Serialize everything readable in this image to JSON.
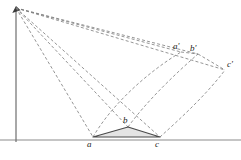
{
  "figure": {
    "canvas": {
      "width": 241,
      "height": 160,
      "background": "#ffffff"
    },
    "colors": {
      "solid_line": "#4a4a4a",
      "dashed_line": "#7a7a7a",
      "axis_line": "#6e6e6e",
      "ground_line": "#8c8c8c",
      "triangle_fill": "#e4e4e4",
      "label_text": "#1d1d1d"
    },
    "style": {
      "dash_pattern": "3,2.2",
      "solid_stroke_width": 1.1,
      "dashed_stroke_width": 0.8,
      "arc_stroke_width": 0.8
    }
  },
  "points": {
    "apex": {
      "name": "apex",
      "label": "",
      "x": 16,
      "y": 8
    },
    "a": {
      "name": "a",
      "label": "a",
      "x": 93,
      "y": 137
    },
    "b": {
      "name": "b",
      "label": "b",
      "x": 128,
      "y": 127
    },
    "c": {
      "name": "c",
      "label": "c",
      "x": 160,
      "y": 137
    },
    "a_pri": {
      "name": "a'",
      "label": "a'",
      "x": 181,
      "y": 52
    },
    "b_pri": {
      "name": "b'",
      "label": "b'",
      "x": 198,
      "y": 54
    },
    "c_pri": {
      "name": "c'",
      "label": "c'",
      "x": 225,
      "y": 70
    }
  },
  "labels": [
    {
      "id": "label-a",
      "text": "a",
      "x": 87,
      "y": 140
    },
    {
      "id": "label-b",
      "text": "b",
      "x": 123,
      "y": 116
    },
    {
      "id": "label-c",
      "text": "c",
      "x": 155,
      "y": 140
    },
    {
      "id": "label-a-prime",
      "text": "a'",
      "x": 173,
      "y": 42
    },
    {
      "id": "label-b-prime",
      "text": "b'",
      "x": 190,
      "y": 44
    },
    {
      "id": "label-c-prime",
      "text": "c'",
      "x": 227,
      "y": 60
    }
  ],
  "axes": {
    "vertical": {
      "name": "vertical-axis",
      "x1": 16,
      "y1": 10,
      "x2": 16,
      "y2": 142
    },
    "ground": {
      "name": "ground-line",
      "x1": 0,
      "y1": 140,
      "x2": 241,
      "y2": 140
    },
    "arrowhead": {
      "name": "axis-arrowhead",
      "x": 16,
      "y": 8,
      "size": 5
    }
  },
  "triangle": {
    "name": "triangle-abc",
    "path": "M 93 137 L 128 127 L 160 137 Z",
    "fill": "#e4e4e4",
    "stroke": "#4a4a4a"
  },
  "dashed_triangle": {
    "name": "triangle-a-prime-b-prime-c-prime",
    "segments": [
      {
        "id": "seg-ap-bp",
        "x1": 181,
        "y1": 52,
        "x2": 198,
        "y2": 54
      },
      {
        "id": "seg-bp-cp",
        "x1": 198,
        "y1": 54,
        "x2": 225,
        "y2": 70
      }
    ]
  },
  "rays": [
    {
      "id": "ray-apex-a-prime",
      "from": "apex",
      "to": "a_pri",
      "x1": 16,
      "y1": 8,
      "x2": 181,
      "y2": 52
    },
    {
      "id": "ray-apex-b-prime",
      "from": "apex",
      "to": "b_pri",
      "x1": 16,
      "y1": 8,
      "x2": 198,
      "y2": 54
    },
    {
      "id": "ray-apex-c-prime",
      "from": "apex",
      "to": "c_pri",
      "x1": 16,
      "y1": 8,
      "x2": 225,
      "y2": 70
    },
    {
      "id": "ray-apex-a",
      "from": "apex",
      "to": "a",
      "x1": 16,
      "y1": 8,
      "x2": 93,
      "y2": 137
    },
    {
      "id": "ray-apex-b",
      "from": "apex",
      "to": "b",
      "x1": 16,
      "y1": 8,
      "x2": 128,
      "y2": 127
    },
    {
      "id": "ray-apex-c",
      "from": "apex",
      "to": "c",
      "x1": 16,
      "y1": 8,
      "x2": 160,
      "y2": 137
    }
  ],
  "arcs": [
    {
      "id": "arc-a-to-a-prime",
      "from": "a",
      "to": "a_pri",
      "d": "M 93 137 C 112 104 148 72 181 52"
    },
    {
      "id": "arc-b-to-b-prime",
      "from": "b",
      "to": "b_pri",
      "d": "M 128 127 C 146 102 175 74 198 54"
    },
    {
      "id": "arc-c-to-c-prime",
      "from": "c",
      "to": "c_pri",
      "d": "M 160 137 C 181 118 207 94 225 70"
    }
  ]
}
